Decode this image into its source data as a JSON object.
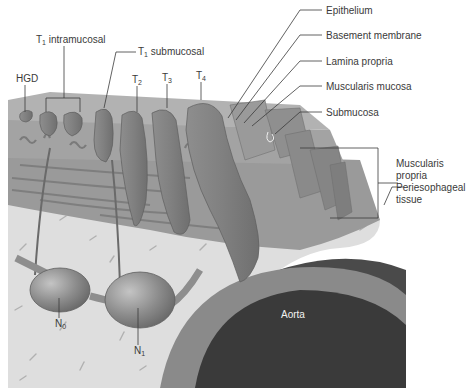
{
  "diagram": {
    "layers": [
      {
        "key": "epithelium",
        "label": "Epithelium"
      },
      {
        "key": "basement",
        "label": "Basement membrane"
      },
      {
        "key": "lamina",
        "label": "Lamina propria"
      },
      {
        "key": "musc_mucosa",
        "label": "Muscularis mucosa"
      },
      {
        "key": "submucosa",
        "label": "Submucosa"
      },
      {
        "key": "musc_propria_1",
        "label": "Muscularis"
      },
      {
        "key": "musc_propria_2",
        "label": "propria"
      },
      {
        "key": "peri_1",
        "label": "Periesophageal"
      },
      {
        "key": "peri_2",
        "label": "tissue"
      }
    ],
    "tumors": {
      "hgd": "HGD",
      "t1_intra_main": "T",
      "t1_intra_sub": "1",
      "t1_intra_rest": " intramucosal",
      "t1_sub_main": "T",
      "t1_sub_sub": "1",
      "t1_sub_rest": " submucosal",
      "t2_main": "T",
      "t2_sub": "2",
      "t3_main": "T",
      "t3_sub": "3",
      "t4_main": "T",
      "t4_sub": "4"
    },
    "nodes": {
      "n0_main": "N",
      "n0_sub": "0",
      "n1_main": "N",
      "n1_sub": "1"
    },
    "structures": {
      "aorta": "Aorta"
    },
    "colors": {
      "tumor": "#7d7d7d",
      "mucosa": "#a9a9a9",
      "submucosa": "#9c9c9c",
      "periesophageal": "#dedede",
      "aorta_wall": "#8a8a8a",
      "aorta_lumen": "#3a3a3a",
      "outer_dark": "#4a4a4a",
      "leader": "#3a3a3a"
    }
  }
}
